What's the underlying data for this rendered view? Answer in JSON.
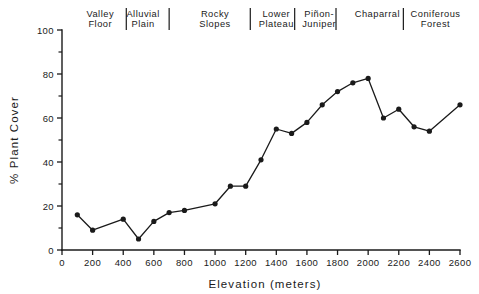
{
  "chart_data": {
    "type": "line",
    "title": "",
    "xlabel": "Elevation  (meters)",
    "ylabel": "% Plant Cover",
    "xlim": [
      0,
      2600
    ],
    "ylim": [
      0,
      100
    ],
    "grid": false,
    "legend": "none",
    "x_ticks": [
      0,
      200,
      400,
      600,
      800,
      1000,
      1200,
      1400,
      1600,
      1800,
      2000,
      2200,
      2400,
      2600
    ],
    "x_tick_labels": [
      "0",
      "200",
      "400",
      "600",
      "800",
      "1000",
      "1200",
      "1400",
      "1600",
      "1800",
      "2000",
      "2200",
      "2400",
      "2600"
    ],
    "y_ticks": [
      0,
      20,
      40,
      60,
      80,
      100
    ],
    "y_tick_labels": [
      "0",
      "20",
      "40",
      "60",
      "80",
      "100"
    ],
    "y_minor_ticks": [
      10,
      30,
      50,
      70,
      90
    ],
    "series": [
      {
        "name": "% Plant Cover",
        "marker": "filled-circle",
        "color": "#1a1a1a",
        "x": [
          100,
          200,
          400,
          500,
          600,
          700,
          800,
          1000,
          1100,
          1200,
          1300,
          1400,
          1500,
          1600,
          1700,
          1800,
          1900,
          2000,
          2100,
          2200,
          2300,
          2400,
          2600
        ],
        "values": [
          16,
          9,
          14,
          5,
          13,
          17,
          18,
          21,
          29,
          29,
          41,
          55,
          53,
          58,
          66,
          72,
          76,
          78,
          60,
          64,
          56,
          54,
          66
        ]
      }
    ],
    "zones": [
      {
        "label_line1": "Valley",
        "label_line2": "Floor",
        "center": 250,
        "divider_after": 420
      },
      {
        "label_line1": "Alluvial",
        "label_line2": "Plain",
        "center": 530,
        "divider_after": 700
      },
      {
        "label_line1": "Rocky",
        "label_line2": "Slopes",
        "center": 1000,
        "divider_after": 1230
      },
      {
        "label_line1": "Lower",
        "label_line2": "Plateau",
        "center": 1400,
        "divider_after": 1520
      },
      {
        "label_line1": "Piñon-",
        "label_line2": "Juniper",
        "center": 1680,
        "divider_after": 1790
      },
      {
        "label_line1": "Chaparral",
        "label_line2": "",
        "center": 2060,
        "divider_after": 2230
      },
      {
        "label_line1": "Coniferous",
        "label_line2": "Forest",
        "center": 2440,
        "divider_after": null
      }
    ]
  }
}
